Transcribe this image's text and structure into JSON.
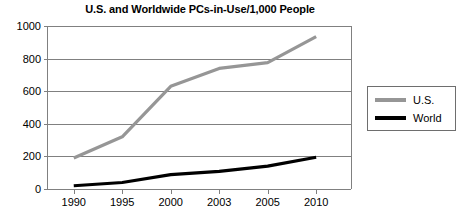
{
  "chart_data": {
    "type": "line",
    "title": "U.S. and Worldwide PCs-in-Use/1,000 People",
    "xlabel": "",
    "ylabel": "",
    "categories": [
      "1990",
      "1995",
      "2000",
      "2003",
      "2005",
      "2010"
    ],
    "ylim": [
      0,
      1000
    ],
    "yticks": [
      0,
      200,
      400,
      600,
      800,
      1000
    ],
    "ytick_labels": [
      "0",
      "200",
      "400",
      "600",
      "800",
      "1000"
    ],
    "grid": "horizontal",
    "legend_position": "right",
    "series": [
      {
        "name": "U.S.",
        "color": "#969696",
        "values": [
          190,
          320,
          630,
          740,
          775,
          935
        ]
      },
      {
        "name": "World",
        "color": "#000000",
        "values": [
          20,
          40,
          88,
          108,
          140,
          195
        ]
      }
    ]
  },
  "legend": {
    "items": [
      {
        "label": "U.S."
      },
      {
        "label": "World"
      }
    ]
  },
  "colors": {
    "us_series": "#969696",
    "world_series": "#000000",
    "gridline": "#808080",
    "axis": "#808080",
    "legend_border": "#6e6e6e",
    "background": "#ffffff"
  }
}
